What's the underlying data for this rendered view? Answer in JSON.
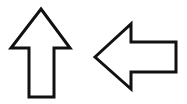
{
  "canvas": {
    "width": 187,
    "height": 104,
    "background_color": "#ffffff",
    "description": "Two black outlined arrow glyphs on a white background"
  },
  "style": {
    "stroke_color": "#111111",
    "fill_color": "#ffffff",
    "stroke_width": 3,
    "stroke_linejoin": "miter"
  },
  "shapes": [
    {
      "id": "up-arrow",
      "semantic_name": "arrow-up-icon",
      "direction": "up",
      "label": "Up arrow",
      "bounding_box": {
        "x": 11,
        "y": 9,
        "width": 59,
        "height": 89
      },
      "tip_point": {
        "x": 41,
        "y": 9
      },
      "shaft": {
        "left": 29,
        "right": 54,
        "top": 49,
        "bottom": 97
      },
      "head": {
        "left_barb_x": 11,
        "right_barb_x": 70,
        "barb_y": 48
      },
      "points": "41,9 70,48 54,48 54,97 29,97 29,48 11,48"
    },
    {
      "id": "left-arrow",
      "semantic_name": "arrow-left-icon",
      "direction": "left",
      "label": "Left arrow",
      "bounding_box": {
        "x": 95,
        "y": 24,
        "width": 82,
        "height": 65
      },
      "tip_point": {
        "x": 95,
        "y": 57
      },
      "shaft": {
        "left": 131,
        "right": 176,
        "top": 42,
        "bottom": 72
      },
      "head": {
        "top_barb_y": 24,
        "bottom_barb_y": 89,
        "barb_x": 131
      },
      "points": "95,57 131,24 131,42 176,42 176,72 131,72 131,89"
    }
  ]
}
